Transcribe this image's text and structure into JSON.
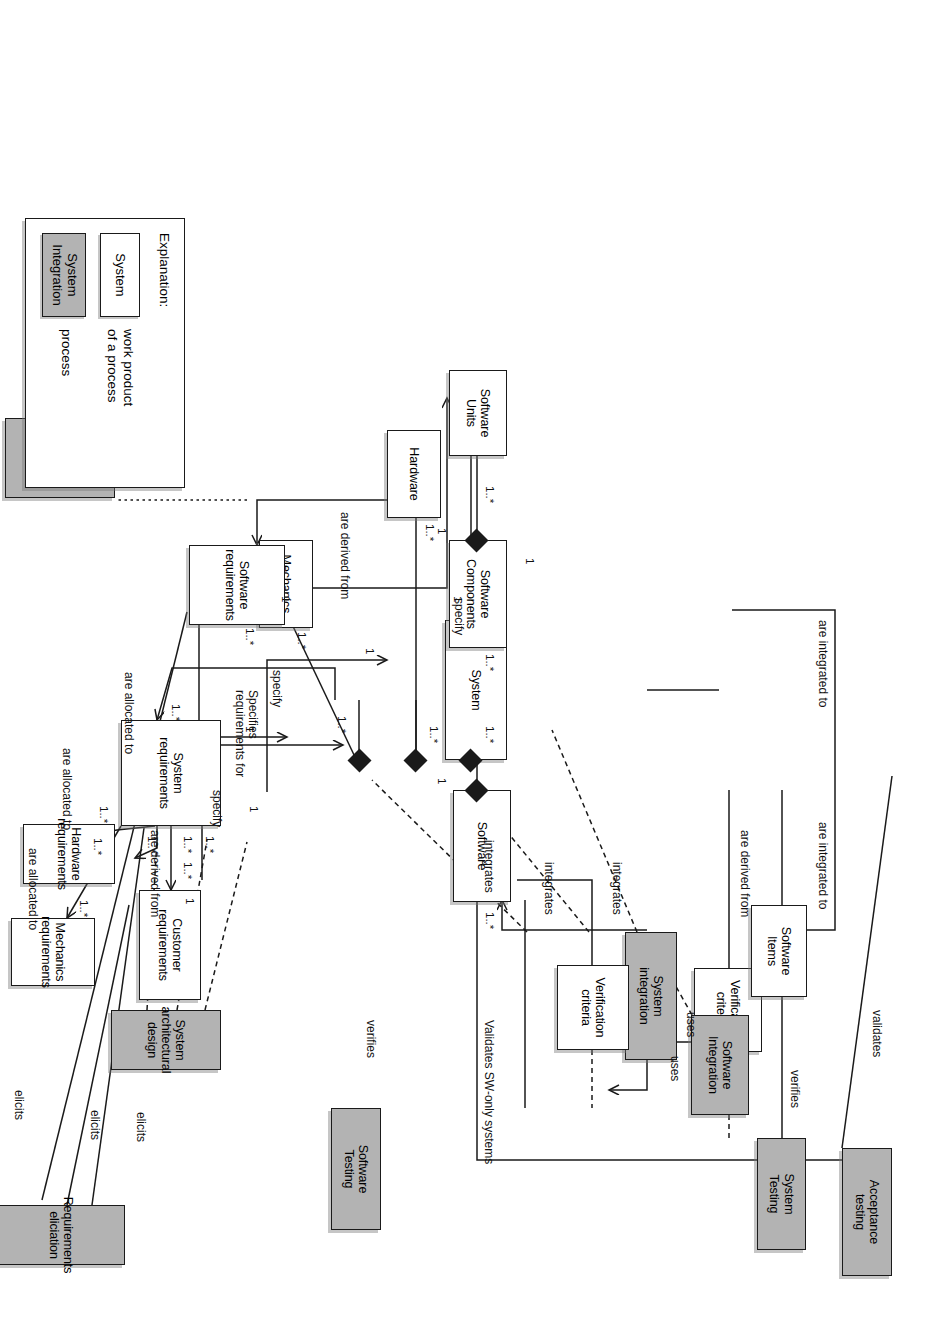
{
  "diagram": {
    "colors": {
      "process_fill": "#b3b3b3",
      "product_fill": "#ffffff",
      "line": "#1a1a1a"
    },
    "node_kinds": {
      "process": "process",
      "work_product": "work product of a process"
    }
  },
  "nodes": {
    "acceptance_testing": {
      "label": "Acceptance\ntesting",
      "kind": "process"
    },
    "system_testing": {
      "label": "System\nTesting",
      "kind": "process"
    },
    "verification_criteria_sys": {
      "label": "Verification\ncriteria",
      "kind": "work_product"
    },
    "system_integration": {
      "label": "System\nintegration",
      "kind": "process"
    },
    "system": {
      "label": "System",
      "kind": "work_product"
    },
    "mechanics": {
      "label": "Mechanics",
      "kind": "work_product"
    },
    "hardware": {
      "label": "Hardware",
      "kind": "work_product"
    },
    "customer_requirements": {
      "label": "Customer\nrequirements",
      "kind": "work_product"
    },
    "system_requirements": {
      "label": "System\nrequirements",
      "kind": "work_product"
    },
    "system_arch_design": {
      "label": "System\narchitectural design",
      "kind": "process"
    },
    "requirements_elicitation": {
      "label": "Requirements\neliciation",
      "kind": "process"
    },
    "mechanics_requirements": {
      "label": "Mechanics\nrequirements",
      "kind": "work_product"
    },
    "hardware_requirements": {
      "label": "Hardware\nrequirements",
      "kind": "work_product"
    },
    "software_requirements": {
      "label": "Software\nrequirements",
      "kind": "work_product"
    },
    "software_design": {
      "label": "Software\ndesign",
      "kind": "process"
    },
    "software_testing": {
      "label": "Software\nTesting",
      "kind": "process"
    },
    "verification_criteria_sw": {
      "label": "Verification\ncriteria",
      "kind": "work_product"
    },
    "software_integration": {
      "label": "Software\nIntegration",
      "kind": "process"
    },
    "software_items": {
      "label": "Software\nItems",
      "kind": "work_product"
    },
    "software": {
      "label": "Software",
      "kind": "work_product"
    },
    "software_components": {
      "label": "Software\nComponents",
      "kind": "work_product"
    },
    "software_units": {
      "label": "Software\nUnits",
      "kind": "work_product"
    }
  },
  "edge_labels": {
    "validates": "validates",
    "verifies_system": "verifies",
    "uses_system": "uses",
    "are_derived_from_sysreq": "are derived from",
    "integrates_1": "integrates",
    "integrates_2": "integrates",
    "integrates_3": "integrates",
    "validates_sw_only": "Validates SW-only systems",
    "specifies_requirements_for": "Specifies\nrequirements for",
    "are_derived_from_custreq": "are derived from",
    "elicits_customer": "elicits",
    "elicits_system": "elicits",
    "elicits_software": "elicits",
    "specify_mechanics": "specify",
    "specify_hardware": "specify",
    "specify_software": "specify",
    "allocated_mechanics": "are allocated to",
    "allocated_hardware": "are allocated to",
    "allocated_software": "are allocated to",
    "verifies_software": "verifies",
    "uses_software": "uses",
    "are_integrated_to_items": "are integrated to",
    "are_integrated_to_units": "are integrated to",
    "are_derived_from_swreq": "are derived from"
  },
  "multiplicities": {
    "sys_mech": "1..*",
    "sys_hw": "1..*",
    "sys_sw": "1..*",
    "mech_end": "1..*",
    "hw_end": "1..*",
    "sw_end": "1..*",
    "custreq_left": "1..*",
    "custreq_right": "1..*",
    "sysreq_to_system": "1..*",
    "sysreq_mech": "1..*",
    "sysreq_hw": "1..*",
    "sysreq_sw": "1..*",
    "mechreq_end": "1..*",
    "hwreq_end": "1..*",
    "swreq_end": "1..*",
    "mechreq_specify": "1",
    "hwreq_specify": "1",
    "swreq_specify": "1",
    "mech_specify": "1",
    "hw_specify": "1",
    "sw_specify": "1",
    "sw_one": "1",
    "swcomp_many": "1..*",
    "swcomp_one": "1",
    "swunits_many": "1..*",
    "swunits_one": "1"
  },
  "legend": {
    "title": "Explanation:",
    "entries": [
      {
        "sample": "System",
        "kind": "work_product",
        "text": "work product\nof a process"
      },
      {
        "sample": "System\nIntegration",
        "kind": "process",
        "text": "process"
      }
    ]
  }
}
